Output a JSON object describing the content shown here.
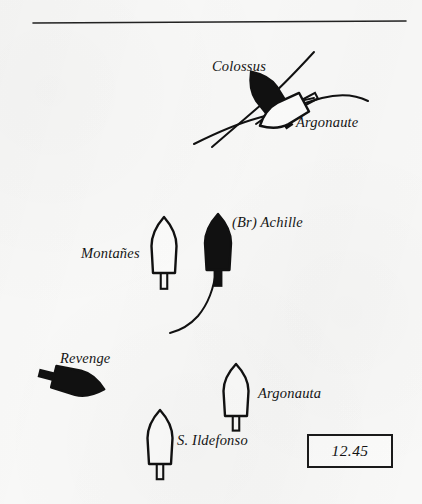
{
  "figure": {
    "kind": "naval-battle-diagram",
    "background_color": "#f8f8f7",
    "ink_color": "#111111",
    "width": 422,
    "height": 504
  },
  "rule": {
    "name": "top-horizontal-rule",
    "x1": 33,
    "y1": 23,
    "x2": 406,
    "y2": 21,
    "thickness": 1.6
  },
  "time_box": {
    "label": "12.45",
    "x": 307,
    "y": 434,
    "width": 82,
    "height": 30
  },
  "labels": [
    {
      "text": "Colossus",
      "x": 212,
      "y": 58,
      "size": 14.5
    },
    {
      "text": "Argonaute",
      "x": 296,
      "y": 114,
      "size": 14.5
    },
    {
      "text": "(Br) Achille",
      "x": 232,
      "y": 214,
      "size": 14.5
    },
    {
      "text": "Montañes",
      "x": 81,
      "y": 245,
      "size": 14.5
    },
    {
      "text": "Revenge",
      "x": 60,
      "y": 350,
      "size": 14.5
    },
    {
      "text": "Argonauta",
      "x": 258,
      "y": 385,
      "size": 14.5
    },
    {
      "text": "S. Ildefonso",
      "x": 177,
      "y": 432,
      "size": 14.5
    }
  ],
  "ships": [
    {
      "name": "Colossus",
      "fill": "filled",
      "cx": 266,
      "cy": 93,
      "length": 52,
      "beam": 25,
      "rotation": -35
    },
    {
      "name": "Argonaute",
      "fill": "outline",
      "cx": 282,
      "cy": 114,
      "length": 50,
      "beam": 24,
      "rotation": -118
    },
    {
      "name": "(Br) Achille",
      "fill": "filled",
      "cx": 218,
      "cy": 242,
      "length": 56,
      "beam": 26,
      "rotation": 0
    },
    {
      "name": "Montañes",
      "fill": "outline",
      "cx": 164,
      "cy": 245,
      "length": 56,
      "beam": 25,
      "rotation": 0
    },
    {
      "name": "Revenge",
      "fill": "filled",
      "cx": 79,
      "cy": 383,
      "length": 52,
      "beam": 25,
      "rotation": 104
    },
    {
      "name": "Argonauta",
      "fill": "outline",
      "cx": 236,
      "cy": 390,
      "length": 52,
      "beam": 25,
      "rotation": 0
    },
    {
      "name": "S. Ildefonso",
      "fill": "outline",
      "cx": 160,
      "cy": 437,
      "length": 54,
      "beam": 25,
      "rotation": 0
    }
  ],
  "tracks": [
    {
      "name": "colossus-track",
      "d": "M 212 147 C 232 130 248 116 262 104 C 276 92 292 76 314 52"
    },
    {
      "name": "argonaute-track",
      "d": "M 194 144 C 214 134 236 124 258 118 C 280 112 300 104 322 98 C 342 93 356 95 368 101"
    },
    {
      "name": "argonaute-track-lower",
      "d": "M 256 124 C 272 112 292 102 314 98"
    },
    {
      "name": "achille-wake",
      "d": "M 216 270 C 214 288 208 304 198 316 C 189 326 178 331 170 333"
    }
  ]
}
